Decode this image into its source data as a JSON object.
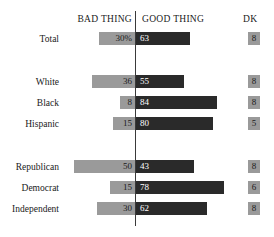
{
  "header": {
    "bad_label": "BAD THING",
    "good_label": "GOOD THING",
    "dk_label": "DK"
  },
  "chart_data": {
    "type": "bar",
    "subtype": "diverging-stacked-bar",
    "title": "",
    "xlabel": "",
    "ylabel": "",
    "grid": false,
    "legend_position": "top",
    "axis_note": "Bars diverge from a centre line: BAD THING extends left, GOOD THING extends right. DK shown as separate boxes at far right.",
    "categories": [
      "Total",
      "White",
      "Black",
      "Hispanic",
      "Republican",
      "Democrat",
      "Independent"
    ],
    "series": [
      {
        "name": "BAD THING",
        "values": [
          30,
          36,
          8,
          15,
          50,
          15,
          30
        ]
      },
      {
        "name": "GOOD THING",
        "values": [
          63,
          55,
          84,
          80,
          43,
          78,
          62
        ]
      },
      {
        "name": "DK",
        "values": [
          8,
          8,
          8,
          5,
          8,
          6,
          8
        ]
      }
    ],
    "colors": {
      "bad": "#9a9a9a",
      "good": "#2a2a2a",
      "dk": "#9a9a9a",
      "divider": "#3a3a3a",
      "background": "#ffffff"
    }
  },
  "rows": [
    {
      "label": "Total",
      "top": 32,
      "bad": {
        "value": 30,
        "text": "30%",
        "width": 36
      },
      "good": {
        "value": 63,
        "text": "63",
        "width": 54
      },
      "dk": {
        "value": 8,
        "text": "8"
      }
    },
    {
      "label": "White",
      "top": 75,
      "bad": {
        "value": 36,
        "text": "36",
        "width": 43
      },
      "good": {
        "value": 55,
        "text": "55",
        "width": 48
      },
      "dk": {
        "value": 8,
        "text": "8"
      }
    },
    {
      "label": "Black",
      "top": 96,
      "bad": {
        "value": 8,
        "text": "8",
        "width": 15
      },
      "good": {
        "value": 84,
        "text": "84",
        "width": 81
      },
      "dk": {
        "value": 8,
        "text": "8"
      }
    },
    {
      "label": "Hispanic",
      "top": 117,
      "bad": {
        "value": 15,
        "text": "15",
        "width": 22
      },
      "good": {
        "value": 80,
        "text": "80",
        "width": 77
      },
      "dk": {
        "value": 5,
        "text": "5"
      }
    },
    {
      "label": "Republican",
      "top": 160,
      "bad": {
        "value": 50,
        "text": "50",
        "width": 61
      },
      "good": {
        "value": 43,
        "text": "43",
        "width": 58
      },
      "dk": {
        "value": 8,
        "text": "8"
      }
    },
    {
      "label": "Democrat",
      "top": 181,
      "bad": {
        "value": 15,
        "text": "15",
        "width": 25
      },
      "good": {
        "value": 78,
        "text": "78",
        "width": 88
      },
      "dk": {
        "value": 6,
        "text": "6"
      }
    },
    {
      "label": "Independent",
      "top": 202,
      "bad": {
        "value": 30,
        "text": "30",
        "width": 38
      },
      "good": {
        "value": 62,
        "text": "62",
        "width": 71
      },
      "dk": {
        "value": 8,
        "text": "8"
      }
    }
  ]
}
